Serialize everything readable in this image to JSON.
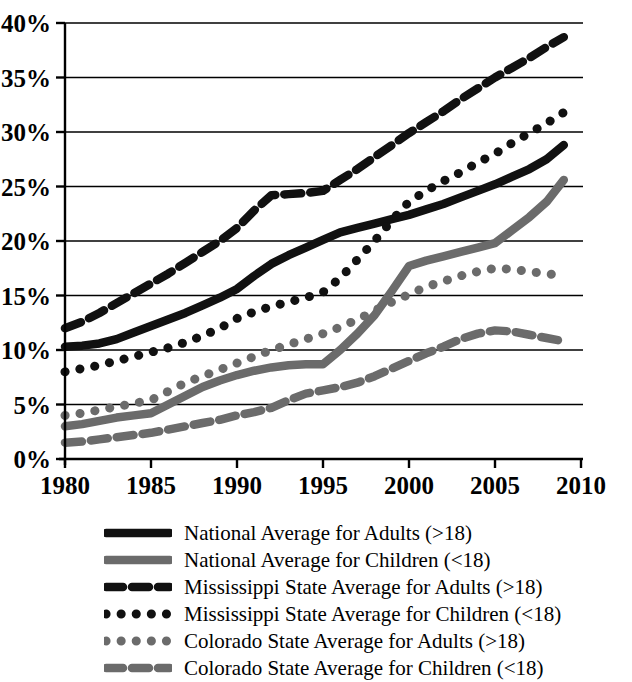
{
  "chart_data": {
    "type": "line",
    "title": "",
    "subtitle": "",
    "xlabel": "",
    "ylabel": "",
    "xlim": [
      1980,
      2010
    ],
    "ylim": [
      0,
      40
    ],
    "grid": true,
    "legend_position": "bottom",
    "x_tick_labels": [
      "1980",
      "1985",
      "1990",
      "1995",
      "2000",
      "2005",
      "2010"
    ],
    "x_ticks": [
      1980,
      1985,
      1990,
      1995,
      2000,
      2005,
      2010
    ],
    "y_tick_labels": [
      "0%",
      "5%",
      "10%",
      "15%",
      "20%",
      "25%",
      "30%",
      "35%",
      "40%"
    ],
    "y_ticks": [
      0,
      5,
      10,
      15,
      20,
      25,
      30,
      35,
      40
    ],
    "x": [
      1980,
      1981,
      1982,
      1983,
      1984,
      1985,
      1986,
      1987,
      1988,
      1989,
      1990,
      1991,
      1992,
      1993,
      1994,
      1995,
      1996,
      1997,
      1998,
      1999,
      2000,
      2001,
      2002,
      2003,
      2004,
      2005,
      2006,
      2007,
      2008,
      2009
    ],
    "series": [
      {
        "name": "National Average for Adults (>18)",
        "style": "solid",
        "color": "#111111",
        "values": [
          10.3,
          10.4,
          10.6,
          11.0,
          11.6,
          12.2,
          12.8,
          13.4,
          14.1,
          14.8,
          15.6,
          16.8,
          17.9,
          18.7,
          19.4,
          20.1,
          20.8,
          21.2,
          21.6,
          22.0,
          22.4,
          22.9,
          23.4,
          24.0,
          24.6,
          25.2,
          25.9,
          26.6,
          27.5,
          28.8
        ]
      },
      {
        "name": "National Average for Children (<18)",
        "style": "solid",
        "color": "#6b6b6b",
        "values": [
          3.0,
          3.2,
          3.5,
          3.8,
          4.0,
          4.2,
          5.0,
          5.8,
          6.6,
          7.2,
          7.7,
          8.1,
          8.4,
          8.6,
          8.7,
          8.7,
          10.0,
          11.5,
          13.2,
          15.4,
          17.7,
          18.2,
          18.6,
          19.0,
          19.4,
          19.8,
          21.0,
          22.2,
          23.6,
          25.6
        ]
      },
      {
        "name": "Mississippi State Average for Adults (>18)",
        "style": "dashed",
        "color": "#111111",
        "values": [
          12.0,
          12.6,
          13.4,
          14.3,
          15.2,
          16.1,
          17.0,
          18.0,
          19.0,
          20.0,
          21.2,
          22.8,
          24.2,
          24.3,
          24.4,
          24.6,
          25.6,
          26.6,
          27.7,
          28.8,
          29.9,
          30.9,
          31.9,
          33.0,
          34.0,
          35.0,
          35.9,
          36.8,
          37.8,
          38.7
        ]
      },
      {
        "name": "Mississippi State Average for Children (<18)",
        "style": "dotted",
        "color": "#111111",
        "values": [
          8.0,
          8.3,
          8.6,
          9.0,
          9.4,
          9.8,
          10.2,
          10.7,
          11.3,
          12.0,
          12.9,
          13.5,
          14.0,
          14.4,
          14.8,
          15.3,
          16.6,
          18.3,
          20.0,
          21.9,
          23.6,
          24.6,
          25.5,
          26.3,
          27.2,
          28.0,
          29.0,
          29.9,
          30.8,
          31.8
        ]
      },
      {
        "name": "Colorado State Average for Adults (>18)",
        "style": "dotted",
        "color": "#6b6b6b",
        "values": [
          4.0,
          4.2,
          4.5,
          4.8,
          5.1,
          5.4,
          6.2,
          7.0,
          7.6,
          8.2,
          8.8,
          9.4,
          10.0,
          10.5,
          11.0,
          11.5,
          12.1,
          12.8,
          13.6,
          14.4,
          15.1,
          15.8,
          16.3,
          16.8,
          17.2,
          17.5,
          17.4,
          17.2,
          17.0,
          16.8
        ]
      },
      {
        "name": "Colorado State Average for Children (<18)",
        "style": "dashed",
        "color": "#6b6b6b",
        "values": [
          1.5,
          1.6,
          1.8,
          2.0,
          2.2,
          2.4,
          2.7,
          3.0,
          3.3,
          3.6,
          4.0,
          4.3,
          4.7,
          5.4,
          6.0,
          6.3,
          6.6,
          7.0,
          7.6,
          8.3,
          9.0,
          9.7,
          10.3,
          11.0,
          11.5,
          11.8,
          11.7,
          11.4,
          11.1,
          10.8
        ]
      }
    ]
  },
  "legend": {
    "items": [
      {
        "label": "National Average for Adults (>18)",
        "style": "solid",
        "color": "#111111"
      },
      {
        "label": "National Average for Children (<18)",
        "style": "solid",
        "color": "#6b6b6b"
      },
      {
        "label": "Mississippi State Average for Adults (>18)",
        "style": "dashed",
        "color": "#111111"
      },
      {
        "label": "Mississippi State Average for Children (<18)",
        "style": "dotted",
        "color": "#111111"
      },
      {
        "label": "Colorado State Average for Adults (>18)",
        "style": "dotted",
        "color": "#6b6b6b"
      },
      {
        "label": "Colorado State Average for Children (<18)",
        "style": "dashed",
        "color": "#6b6b6b"
      }
    ]
  }
}
